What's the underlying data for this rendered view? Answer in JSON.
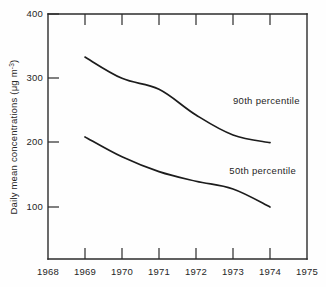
{
  "chart_data": {
    "type": "line",
    "title": "",
    "xlabel": "",
    "ylabel": "Daily mean concentrations (μg m⁻³)",
    "ylabel_parts": {
      "main": "Daily mean concentrations (μg m",
      "superscript": "-3",
      "tail": ")"
    },
    "xlim": [
      1968,
      1975
    ],
    "ylim": [
      0,
      400
    ],
    "grid": false,
    "legend_position": "inline-annotation",
    "x_tick_labels": [
      "1968",
      "1969",
      "1970",
      "1971",
      "1972",
      "1973",
      "1974",
      "1975"
    ],
    "x_ticks": [
      1968,
      1969,
      1970,
      1971,
      1972,
      1973,
      1974,
      1975
    ],
    "y_tick_labels": [
      "100",
      "200",
      "300",
      "400"
    ],
    "y_ticks": [
      100,
      200,
      300,
      400
    ],
    "x": [
      1969,
      1970,
      1971,
      1972,
      1973,
      1974
    ],
    "series": [
      {
        "name": "90th percentile",
        "label": "90th percentile",
        "color": "#1c1c1c",
        "values": [
          333,
          300,
          283,
          243,
          212,
          200
        ],
        "label_x": 1973.0,
        "label_y": 260
      },
      {
        "name": "50th percentile",
        "label": "50th percentile",
        "color": "#1c1c1c",
        "values": [
          209,
          178,
          155,
          140,
          128,
          100
        ],
        "label_x": 1972.9,
        "label_y": 152
      }
    ]
  },
  "figure": {
    "background_color": "#fefefe",
    "axis_color": "#2b2b2b",
    "text_color": "#262626"
  }
}
